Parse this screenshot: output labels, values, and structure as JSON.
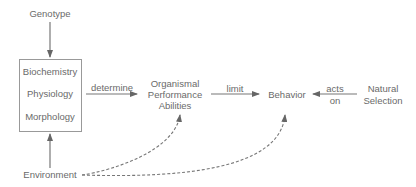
{
  "nodes": {
    "genotype": "Genotype",
    "box": [
      "Biochemistry",
      "Physiology",
      "Morphology"
    ],
    "environment": "Environment",
    "performance": [
      "Organismal",
      "Performance",
      "Abilities"
    ],
    "behavior": "Behavior",
    "selection": [
      "Natural",
      "Selection"
    ]
  },
  "edges": {
    "determine": "determine",
    "limit": "limit",
    "acts_on": [
      "acts",
      "on"
    ]
  },
  "colors": {
    "line": "#777777",
    "text": "#6a6a6a"
  }
}
